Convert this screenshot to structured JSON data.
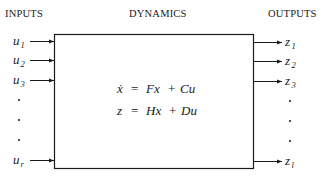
{
  "headers": {
    "inputs": "INPUTS",
    "dynamics": "DYNAMICS",
    "outputs": "OUTPUTS"
  },
  "inputs": [
    {
      "symbol": "u",
      "subscript": "1"
    },
    {
      "symbol": "u",
      "subscript": "2"
    },
    {
      "symbol": "u",
      "subscript": "3"
    },
    {
      "symbol": "u",
      "subscript": "r"
    }
  ],
  "outputs": [
    {
      "symbol": "z",
      "subscript": "1"
    },
    {
      "symbol": "z",
      "subscript": "2"
    },
    {
      "symbol": "z",
      "subscript": "3"
    },
    {
      "symbol": "z",
      "subscript": "l"
    }
  ],
  "equations": {
    "state": {
      "lhs": "ẋ",
      "eq": "=",
      "t1": "Fx",
      "op": "+",
      "t2": "Cu"
    },
    "output": {
      "lhs": "z",
      "eq": "=",
      "t1": "Hx",
      "op": "+",
      "t2": "Du"
    }
  },
  "ellipsis": "·"
}
